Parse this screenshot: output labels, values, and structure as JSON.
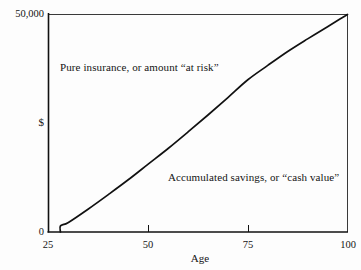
{
  "chart_data": {
    "type": "line",
    "title": "",
    "subtitle": "",
    "xlabel": "Age",
    "ylabel": "$",
    "xlim": [
      25,
      100
    ],
    "ylim": [
      0,
      50000
    ],
    "grid": false,
    "legend_position": "none",
    "x_ticks": [
      25,
      50,
      75,
      100
    ],
    "x_tick_labels": [
      "25",
      "50",
      "75",
      "100"
    ],
    "y_ticks": [
      0,
      50000
    ],
    "y_tick_labels": [
      "0",
      "50,000"
    ],
    "y_axis_symbol": "$",
    "series": [
      {
        "name": "Accumulated savings (cash value)",
        "color": "#111111",
        "x": [
          28,
          28,
          30,
          35,
          40,
          45,
          50,
          55,
          60,
          65,
          70,
          75,
          80,
          85,
          90,
          95,
          98,
          100
        ],
        "y": [
          0,
          1400,
          2200,
          5300,
          8600,
          12000,
          15600,
          19200,
          23000,
          26900,
          30900,
          35000,
          38300,
          41500,
          44400,
          47200,
          48900,
          50000
        ]
      }
    ],
    "annotations": [
      {
        "id": "pure-insurance",
        "text": "Pure insurance, or amount “at risk”",
        "x": 34,
        "y": 38000
      },
      {
        "id": "cash-value",
        "text": "Accumulated savings, or “cash value”",
        "x": 55,
        "y": 12500
      }
    ],
    "axis_color": "#111111",
    "background_color": "#fdfdfd"
  },
  "figure": {
    "x_axis_title": "Age",
    "y_axis_label_top": "50,000",
    "y_axis_label_dollar": "$",
    "y_axis_label_zero": "0",
    "x_tick_25": "25",
    "x_tick_50": "50",
    "x_tick_75": "75",
    "x_tick_100": "100",
    "annotation_pure_insurance": "Pure insurance, or amount “at risk”",
    "annotation_cash_value": "Accumulated savings, or “cash value”"
  }
}
